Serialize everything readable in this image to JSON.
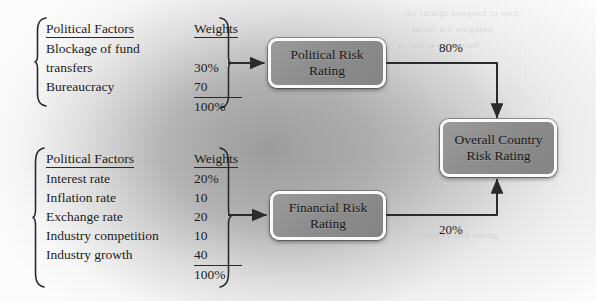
{
  "diagram": {
    "colors": {
      "node_fill": "#8d8d8d",
      "node_border": "#fafafa",
      "line": "#2b2b2b",
      "text": "#1d1d1d",
      "background": "#a5a5a5"
    },
    "ghost_text": [
      "the ratings assigned to each",
      "factor are weighted",
      "to derive an overall",
      "country risk rating"
    ],
    "tables": [
      {
        "id": "political-factors-table",
        "headers": {
          "factors": "Political Factors",
          "weights": "Weights"
        },
        "rows": [
          {
            "factor": "Blockage of fund",
            "weight": ""
          },
          {
            "factor": "transfers",
            "weight": "30%"
          },
          {
            "factor": "Bureaucracy",
            "weight": "70"
          }
        ],
        "total": "100%"
      },
      {
        "id": "financial-factors-table",
        "headers": {
          "factors": "Political Factors",
          "weights": "Weights"
        },
        "rows": [
          {
            "factor": "Interest rate",
            "weight": "20%"
          },
          {
            "factor": "Inflation rate",
            "weight": "10"
          },
          {
            "factor": "Exchange rate",
            "weight": "20"
          },
          {
            "factor": "Industry competition",
            "weight": "10"
          },
          {
            "factor": "Industry growth",
            "weight": "40"
          }
        ],
        "total": "100%"
      }
    ],
    "nodes": [
      {
        "id": "political-risk-rating",
        "line1": "Political Risk",
        "line2": "Rating"
      },
      {
        "id": "financial-risk-rating",
        "line1": "Financial Risk",
        "line2": "Rating"
      },
      {
        "id": "overall-country-risk-rating",
        "line1": "Overall Country",
        "line2": "Risk Rating"
      }
    ],
    "edges": [
      {
        "id": "political-to-overall",
        "label": "80%",
        "from": "political-risk-rating",
        "to": "overall-country-risk-rating"
      },
      {
        "id": "financial-to-overall",
        "label": "20%",
        "from": "financial-risk-rating",
        "to": "overall-country-risk-rating"
      }
    ]
  }
}
